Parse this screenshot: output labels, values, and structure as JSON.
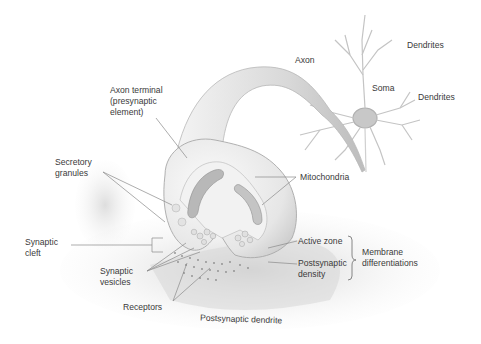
{
  "diagram": {
    "colors": {
      "background": "#ffffff",
      "label_text": "#3a3a3a",
      "leader_line": "#8a8a8a",
      "structure_fill": "#ececec",
      "structure_shade": "#bdbdbd",
      "receptor_dots": "#8c8c8c"
    },
    "labels": {
      "axon": "Axon",
      "dendrites_top": "Dendrites",
      "soma": "Soma",
      "dendrites_right": "Dendrites",
      "axon_terminal": "Axon terminal\n(presynaptic\nelement)",
      "secretory_granules": "Secretory\ngranules",
      "mitochondria": "Mitochondria",
      "synaptic_cleft": "Synaptic\ncleft",
      "active_zone": "Active zone",
      "postsynaptic_density": "Postsynaptic\ndensity",
      "membrane_differentiations": "Membrane\ndifferentiations",
      "synaptic_vesicles": "Synaptic\nvesicles",
      "receptors": "Receptors",
      "postsynaptic_dendrite": "Postsynaptic dendrite"
    }
  }
}
